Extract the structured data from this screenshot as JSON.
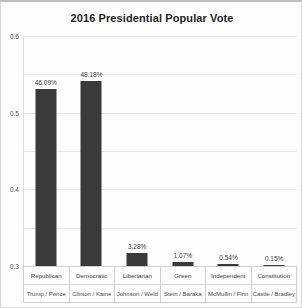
{
  "chart_data": {
    "type": "bar",
    "title": "2016 Presidential Popular Vote",
    "xlabel": "",
    "ylabel": "",
    "ylim": [
      0,
      0.6
    ],
    "grid": true,
    "legend": false,
    "categories": [
      "Republican",
      "Democratic",
      "Libertarian",
      "Green",
      "Independent",
      "Constitution"
    ],
    "category_sublabels": [
      "Trump / Pence",
      "Clinton / Kaine",
      "Johnson / Weld",
      "Stein / Baraka",
      "McMullin / Finn",
      "Castle / Bradley"
    ],
    "values": [
      0.4609,
      0.4818,
      0.0328,
      0.0107,
      0.0054,
      0.0015
    ],
    "value_labels": [
      "46.09%",
      "48.18%",
      "3.28%",
      "1.07%",
      "0.54%",
      "0.15%"
    ],
    "y_ticks": [
      0,
      0.1,
      0.2,
      0.3,
      0.4,
      0.5,
      0.6
    ],
    "y_tick_labels": [
      "0",
      "0.1",
      "0.2",
      "0.3",
      "0.4",
      "0.5",
      "0.6"
    ],
    "bar_color": "#3a3a3a",
    "grid_color": "#e4e4e4"
  }
}
